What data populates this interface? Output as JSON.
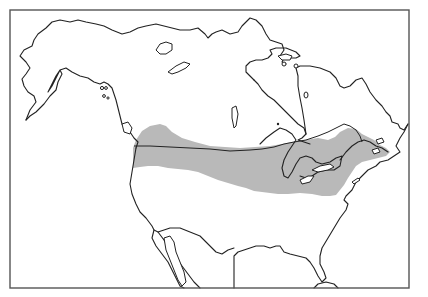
{
  "map": {
    "subject": "Range map of North America",
    "region": "North America (Alaska, Canada, contiguous United States, northern Mexico)",
    "legend": {
      "range_label": "Shaded range",
      "range_color": "#b9b9b9"
    },
    "colors": {
      "background": "#ffffff",
      "coastline": "#222222",
      "frame": "#555555",
      "range_fill": "#b9b9b9"
    },
    "frame": {
      "x": 10,
      "y": 10,
      "width": 399,
      "height": 278
    },
    "shaded_range_description": "Band across southern Canada and northern United States from the Pacific Northwest to the Maritimes, including the Great Lakes region and New England"
  }
}
